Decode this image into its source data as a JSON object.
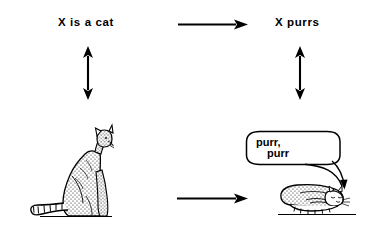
{
  "figure": {
    "background_color": "#ffffff",
    "ink_color": "#000000",
    "width": 372,
    "height": 231
  },
  "labels": {
    "premise": "X  is a cat",
    "conclusion": "X  purrs"
  },
  "speech_bubble": {
    "line1": "purr,",
    "line2": "purr"
  },
  "arrows": {
    "top_horizontal": {
      "name": "implication-arrow",
      "direction": "right",
      "from": "X is a cat",
      "to": "X purrs"
    },
    "left_vertical": {
      "name": "left-correspondence-arrow",
      "direction": "both",
      "from": "X is a cat",
      "to": "sitting-cat"
    },
    "right_vertical": {
      "name": "right-correspondence-arrow",
      "direction": "both",
      "from": "X purrs",
      "to": "lying-cat"
    },
    "bottom_horizontal": {
      "name": "causal-arrow",
      "direction": "right",
      "from": "sitting-cat",
      "to": "lying-cat"
    }
  },
  "illustrations": {
    "sitting_cat": "sitting-cat-illustration",
    "lying_cat": "lying-purring-cat-illustration"
  }
}
